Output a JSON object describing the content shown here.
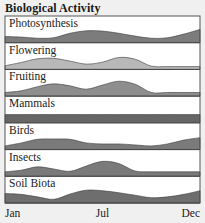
{
  "chart_data": {
    "type": "area",
    "title": "Biological Activity",
    "xlabel": "",
    "ylabel": "",
    "x_ticks": [
      "Jan",
      "Jul",
      "Dec"
    ],
    "x_months": [
      "Jan",
      "Feb",
      "Mar",
      "Apr",
      "May",
      "Jun",
      "Jul",
      "Aug",
      "Sep",
      "Oct",
      "Nov",
      "Dec",
      "Dec-end"
    ],
    "ylim": [
      0,
      1
    ],
    "grid": false,
    "legend": "none",
    "series": [
      {
        "name": "Photosynthesis",
        "color": "#7c7c7c",
        "values": [
          0.25,
          0.22,
          0.15,
          0.18,
          0.45,
          0.6,
          0.58,
          0.45,
          0.28,
          0.15,
          0.18,
          0.4,
          0.68
        ]
      },
      {
        "name": "Flowering",
        "color": "#b8b8b8",
        "values": [
          0.1,
          0.3,
          0.52,
          0.55,
          0.38,
          0.2,
          0.32,
          0.6,
          0.5,
          0.08,
          0.05,
          0.05,
          0.05
        ]
      },
      {
        "name": "Fruiting",
        "color": "#8e8e8e",
        "values": [
          0.1,
          0.2,
          0.45,
          0.62,
          0.5,
          0.3,
          0.55,
          0.78,
          0.6,
          0.1,
          0.1,
          0.1,
          0.1
        ]
      },
      {
        "name": "Mammals",
        "color": "#666666",
        "values": [
          0.38,
          0.38,
          0.38,
          0.38,
          0.38,
          0.38,
          0.38,
          0.38,
          0.38,
          0.38,
          0.38,
          0.38,
          0.38
        ]
      },
      {
        "name": "Birds",
        "color": "#7a7a7a",
        "values": [
          0.1,
          0.28,
          0.5,
          0.52,
          0.5,
          0.28,
          0.22,
          0.22,
          0.16,
          0.1,
          0.22,
          0.45,
          0.6
        ]
      },
      {
        "name": "Insects",
        "color": "#7a7a7a",
        "values": [
          0.15,
          0.25,
          0.45,
          0.32,
          0.18,
          0.5,
          0.78,
          0.65,
          0.2,
          0.15,
          0.15,
          0.15,
          0.15
        ]
      },
      {
        "name": "Soil Biota",
        "color": "#6e6e6e",
        "values": [
          0.45,
          0.4,
          0.25,
          0.1,
          0.42,
          0.65,
          0.62,
          0.5,
          0.35,
          0.2,
          0.25,
          0.4,
          0.62
        ]
      }
    ]
  }
}
